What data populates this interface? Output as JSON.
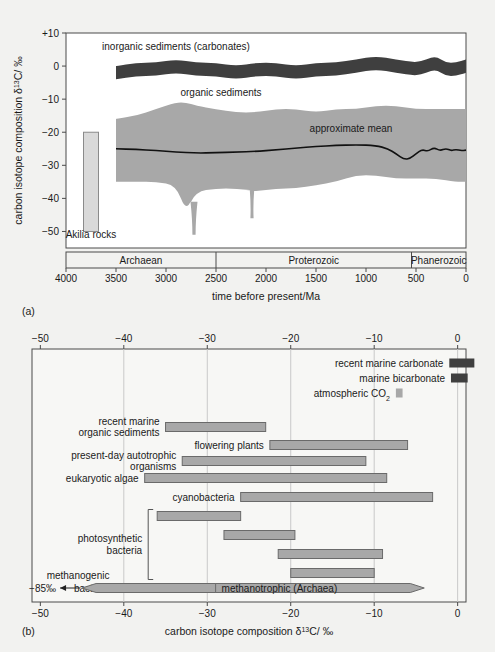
{
  "figure": {
    "panel_a_id": "(a)",
    "panel_b_id": "(b)",
    "colors": {
      "background": "#f2f2f0",
      "plot_bg": "#ffffff",
      "inorganic_band": "#3f3f3f",
      "organic_band": "#a8a8a8",
      "bar_fill": "#a8a8a8",
      "bar_stroke": "#6a6a6a",
      "akilia_fill": "#d9d9d9",
      "axis": "#4a4a4a",
      "mean_line": "#111111"
    }
  },
  "chart_data": [
    {
      "type": "area",
      "panel": "a",
      "title": "",
      "xlabel": "time before present/Ma",
      "ylabel": "carbon isotope composition δ¹³C/ ‰",
      "ylabel_parts": {
        "pre": "carbon isotope composition δ",
        "sup": "13",
        "post": "C/ ‰"
      },
      "xlim": [
        4000,
        0
      ],
      "ylim": [
        -55,
        10
      ],
      "xticks": [
        4000,
        3500,
        3000,
        2500,
        2000,
        1500,
        1000,
        500,
        0
      ],
      "xticklabels": [
        "4000",
        "3500",
        "3000",
        "2500",
        "2000",
        "1500",
        "1000",
        "500",
        "0"
      ],
      "yticks": [
        10,
        0,
        -10,
        -20,
        -30,
        -40,
        -50
      ],
      "yticklabels": [
        "+10",
        "0",
        "−10",
        "−20",
        "−30",
        "−40",
        "−50"
      ],
      "grid": false,
      "annotations": [
        {
          "name": "inorganic-sediments-label",
          "text": "inorganic sediments (carbonates)",
          "x": 2900,
          "y": 5
        },
        {
          "name": "organic-sediments-label",
          "text": "organic sediments",
          "x": 2450,
          "y": -9
        },
        {
          "name": "approximate-mean-label",
          "text": "approximate mean",
          "x": 1150,
          "y": -20
        },
        {
          "name": "akilia-rocks-label",
          "text": "Akilia rocks",
          "x": 3750,
          "y": -52
        }
      ],
      "series": [
        {
          "name": "inorganic sediments (carbonates)",
          "kind": "band",
          "fill": "#3f3f3f",
          "x": [
            3500,
            3300,
            3100,
            2900,
            2700,
            2500,
            2300,
            2100,
            1900,
            1700,
            1500,
            1300,
            1100,
            900,
            700,
            500,
            400,
            300,
            200,
            100,
            0
          ],
          "upper": [
            0,
            1,
            1,
            2,
            1,
            1,
            0,
            1,
            1,
            0,
            1,
            1,
            2,
            3,
            2,
            1,
            2,
            3,
            1,
            1,
            2
          ],
          "lower": [
            -4,
            -3,
            -3,
            -2,
            -3,
            -3,
            -4,
            -3,
            -3,
            -4,
            -3,
            -3,
            -2,
            -1,
            -2,
            -3,
            -2,
            -1,
            -3,
            -3,
            -2
          ]
        },
        {
          "name": "organic sediments",
          "kind": "band",
          "fill": "#a8a8a8",
          "x": [
            3500,
            3300,
            3100,
            2900,
            2800,
            2700,
            2500,
            2300,
            2100,
            1900,
            1700,
            1500,
            1300,
            1100,
            900,
            700,
            500,
            300,
            100,
            0
          ],
          "upper": [
            -16,
            -15,
            -13,
            -11,
            -11,
            -12,
            -13,
            -14,
            -14,
            -13,
            -13,
            -14,
            -13,
            -13,
            -12,
            -12,
            -13,
            -13,
            -13,
            -13
          ],
          "lower": [
            -35,
            -35,
            -35,
            -36,
            -44,
            -38,
            -37,
            -37,
            -38,
            -37,
            -37,
            -36,
            -35,
            -33,
            -33,
            -34,
            -34,
            -34,
            -35,
            -35
          ],
          "spikes": [
            {
              "x": 2720,
              "depth": -51,
              "half_width": 35
            },
            {
              "x": 2140,
              "depth": -46,
              "half_width": 22
            }
          ]
        },
        {
          "name": "approximate mean",
          "kind": "line",
          "stroke": "#111111",
          "x": [
            3500,
            3300,
            3100,
            2900,
            2700,
            2500,
            2300,
            2100,
            1900,
            1700,
            1500,
            1300,
            1100,
            900,
            780,
            700,
            620,
            560,
            500,
            440,
            380,
            320,
            260,
            200,
            150,
            100,
            50,
            0
          ],
          "y": [
            -25,
            -25.2,
            -25.5,
            -26,
            -26.3,
            -26.2,
            -26,
            -25.8,
            -25.3,
            -24.8,
            -24.3,
            -24,
            -23.8,
            -24,
            -25,
            -26.5,
            -28.2,
            -28,
            -26.5,
            -25.2,
            -25.8,
            -24.6,
            -25.6,
            -24.9,
            -25.6,
            -25.2,
            -25.6,
            -25.4
          ]
        },
        {
          "name": "Akilia rocks",
          "kind": "bar",
          "fill": "#d9d9d9",
          "x_center": 3750,
          "x_half_width": 75,
          "y_top": -20,
          "y_bottom": -50
        }
      ],
      "era_bands": [
        {
          "name": "Archaean",
          "from": 4000,
          "to": 2500
        },
        {
          "name": "Proterozoic",
          "from": 2500,
          "to": 545
        },
        {
          "name": "Phanerozoic",
          "from": 545,
          "to": 0
        }
      ]
    },
    {
      "type": "bar",
      "panel": "b",
      "orientation": "horizontal",
      "title": "",
      "xlabel": "carbon isotope composition δ¹³C/ ‰",
      "xlabel_parts": {
        "pre": "carbon isotope composition δ",
        "sup": "13",
        "post": "C/ ‰"
      },
      "ylabel": "",
      "xlim": [
        -51,
        1
      ],
      "xticks": [
        -50,
        -40,
        -30,
        -20,
        -10,
        0
      ],
      "xticklabels": [
        "−50",
        "−40",
        "−30",
        "−20",
        "−10",
        "0"
      ],
      "ticks_top": true,
      "grid": true,
      "gridlines": [
        -40,
        -30,
        -20,
        -10,
        0
      ],
      "legend_items": [
        {
          "name": "recent marine carbonate",
          "label": "recent marine carbonate",
          "from": -1.0,
          "to": 2.0,
          "fill": "#3f3f3f"
        },
        {
          "name": "marine bicarbonate",
          "label": "marine bicarbonate",
          "from": -0.8,
          "to": 1.2,
          "fill": "#3f3f3f"
        },
        {
          "name": "atmospheric CO2",
          "label": "atmospheric CO₂",
          "label_parts": {
            "pre": "atmospheric CO",
            "sub": "2"
          },
          "from": -7.4,
          "to": -6.6,
          "fill": "#a8a8a8"
        }
      ],
      "bars": [
        {
          "name": "recent marine organic sediments",
          "label": "recent marine\norganic sediments",
          "label_lines": [
            "recent marine",
            "organic sediments"
          ],
          "from": -35.0,
          "to": -23.0
        },
        {
          "name": "flowering plants",
          "label": "flowering plants",
          "label_lines": [
            "flowering plants"
          ],
          "from": -22.5,
          "to": -6.0
        },
        {
          "name": "present-day autotrophic organisms",
          "label": "present-day autotrophic\norganisms",
          "label_lines": [
            "present-day autotrophic",
            "organisms"
          ],
          "from": -33.0,
          "to": -11.0
        },
        {
          "name": "eukaryotic algae",
          "label": "eukaryotic algae",
          "label_lines": [
            "eukaryotic algae"
          ],
          "from": -37.5,
          "to": -8.5
        },
        {
          "name": "cyanobacteria",
          "label": "cyanobacteria",
          "label_lines": [
            "cyanobacteria"
          ],
          "from": -26.0,
          "to": -3.0
        },
        {
          "name": "photosynthetic bacteria 1",
          "label": "",
          "label_lines": [],
          "from": -36.0,
          "to": -26.0,
          "group": "photosynthetic bacteria"
        },
        {
          "name": "photosynthetic bacteria 2",
          "label": "",
          "label_lines": [],
          "from": -28.0,
          "to": -19.5,
          "group": "photosynthetic bacteria"
        },
        {
          "name": "photosynthetic bacteria 3",
          "label": "",
          "label_lines": [],
          "from": -21.5,
          "to": -9.0,
          "group": "photosynthetic bacteria"
        },
        {
          "name": "photosynthetic bacteria 4",
          "label": "",
          "label_lines": [],
          "from": -20.0,
          "to": -10.0,
          "group": "photosynthetic bacteria"
        }
      ],
      "group_brackets": [
        {
          "name": "photosynthetic bacteria",
          "label_lines": [
            "photosynthetic",
            "bacteria"
          ]
        }
      ],
      "arrow_bars": [
        {
          "name": "methanogenic bacteria",
          "label_lines": [
            "methanogenic",
            "bacteria"
          ],
          "from": -41.0,
          "to": -4.0,
          "direction": "right"
        },
        {
          "name": "methanotrophic (Archaea)",
          "label": "methanotrophic (Archaea)",
          "from": -29.0,
          "to": -45.0,
          "direction": "left",
          "off_scale_label": "−85‰"
        }
      ]
    }
  ]
}
